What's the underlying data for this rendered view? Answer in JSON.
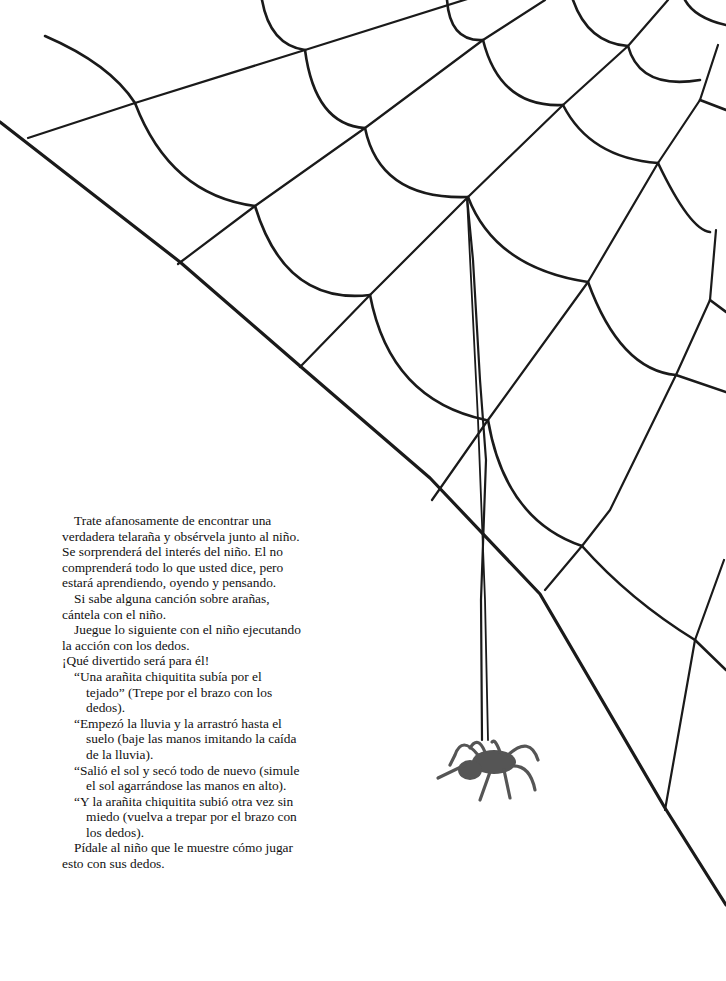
{
  "document": {
    "language": "es",
    "illustration": {
      "subject": "spider web with a spider hanging from a thread",
      "stroke_color": "#1a1a1a",
      "spider_color": "#555555"
    },
    "paragraphs": [
      {
        "id": "p1",
        "type": "paragraph",
        "text": "Trate afanosamente de encontrar una verdadera telaraña y obsérvela junto al niño. Se sorprenderá del interés del niño. El no comprenderá todo lo que usted dice, pero estará aprendiendo, oyendo y pensando."
      },
      {
        "id": "p2",
        "type": "paragraph",
        "text": "Si sabe alguna canción sobre arañas, cántela con el niño."
      },
      {
        "id": "p3",
        "type": "paragraph",
        "text": "Juegue lo siguiente con el niño ejecutando la acción con los dedos."
      },
      {
        "id": "p4",
        "type": "paragraph-flush",
        "text": "¡Qué divertido será para él!"
      },
      {
        "id": "v1",
        "type": "verse",
        "text": "“Una arañita chiquitita subía por el tejado” (Trepe por el brazo con los dedos)."
      },
      {
        "id": "v2",
        "type": "verse",
        "text": "“Empezó la lluvia y la arrastró hasta el suelo (baje las manos imitando la caída de la lluvia)."
      },
      {
        "id": "v3",
        "type": "verse",
        "text": "“Salió el sol y secó todo de nuevo (simule el sol agarrándose las manos en alto)."
      },
      {
        "id": "v4",
        "type": "verse",
        "text": "“Y la arañita chiquitita subió otra vez sin miedo (vuelva a trepar por el brazo con los dedos)."
      },
      {
        "id": "p5",
        "type": "paragraph",
        "text": "Pídale al niño que le muestre cómo jugar esto con sus dedos."
      }
    ]
  }
}
